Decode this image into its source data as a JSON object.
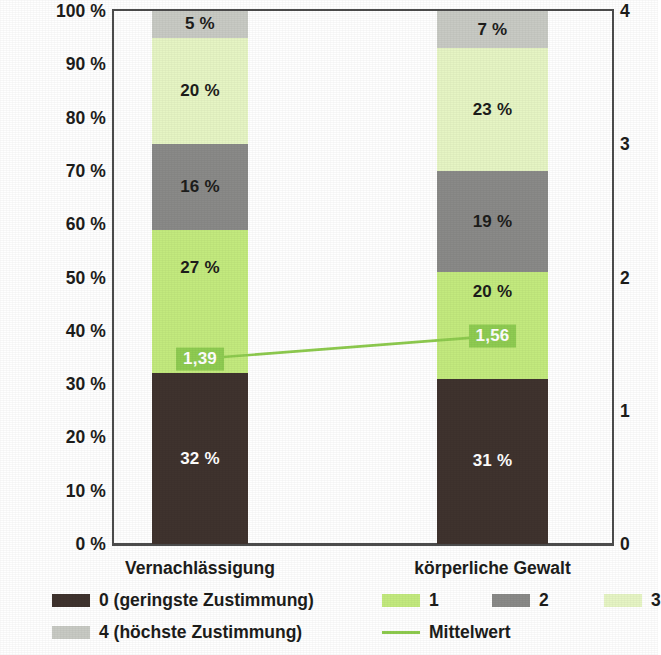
{
  "chart_data": {
    "type": "bar",
    "subtype": "stacked-100-percent-with-mean-line",
    "title": "",
    "subtitle": "",
    "xlabel": "",
    "ylabel": "",
    "categories": [
      "Vernachlässigung",
      "körperliche Gewalt"
    ],
    "series": [
      {
        "name": "0 (geringste Zustimmung)",
        "short": "0",
        "color": "#3f332e",
        "label_color": "#ffffff",
        "values": [
          32,
          31
        ],
        "value_labels": [
          "32 %",
          "31 %"
        ]
      },
      {
        "name": "1",
        "short": "1",
        "color": "#c3ea7e",
        "label_color": "#1d1d1b",
        "values": [
          27,
          20
        ],
        "value_labels": [
          "27 %",
          "20 %"
        ]
      },
      {
        "name": "2",
        "short": "2",
        "color": "#8a8a88",
        "label_color": "#1d1d1b",
        "values": [
          16,
          19
        ],
        "value_labels": [
          "16 %",
          "19 %"
        ]
      },
      {
        "name": "3",
        "short": "3",
        "color": "#e6f5c4",
        "label_color": "#1d1d1b",
        "values": [
          20,
          23
        ],
        "value_labels": [
          "20 %",
          "23 %"
        ]
      },
      {
        "name": "4 (höchste Zustimmung)",
        "short": "4",
        "color": "#c8cac4",
        "label_color": "#1d1d1b",
        "values": [
          5,
          7
        ],
        "value_labels": [
          "5 %",
          "7 %"
        ]
      }
    ],
    "mean_series": {
      "name": "Mittelwert",
      "color": "#8ecb4f",
      "values": [
        1.39,
        1.56
      ],
      "value_labels": [
        "1,39",
        "1,56"
      ],
      "label_bg": "#8fcc52",
      "label_text_color": "#ffffff"
    },
    "left_axis": {
      "title": "",
      "unit": "%",
      "min": 0,
      "max": 100,
      "step": 10,
      "ticks": [
        "0 %",
        "10 %",
        "20 %",
        "30 %",
        "40 %",
        "50 %",
        "60 %",
        "70 %",
        "80 %",
        "90 %",
        "100 %"
      ]
    },
    "right_axis": {
      "title": "",
      "min": 0,
      "max": 4,
      "step": 1,
      "ticks": [
        "0",
        "1",
        "2",
        "3",
        "4"
      ]
    },
    "grid": false,
    "legend": {
      "position": "bottom",
      "entries": [
        {
          "label": "0 (geringste Zustimmung)",
          "marker": "swatch",
          "color": "#3f332e"
        },
        {
          "label": "1",
          "marker": "swatch",
          "color": "#c3ea7e"
        },
        {
          "label": "2",
          "marker": "swatch",
          "color": "#8a8a88"
        },
        {
          "label": "3",
          "marker": "swatch",
          "color": "#e6f5c4"
        },
        {
          "label": "4 (höchste Zustimmung)",
          "marker": "swatch",
          "color": "#c8cac4"
        },
        {
          "label": "Mittelwert",
          "marker": "line",
          "color": "#8ecb4f"
        }
      ]
    }
  }
}
